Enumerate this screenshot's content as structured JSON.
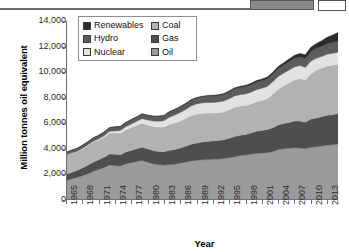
{
  "top_bar": {
    "present": true,
    "description": "cropped-ui-strip"
  },
  "chart_data": {
    "type": "area",
    "stacked": true,
    "title": "",
    "xlabel": "Year",
    "ylabel": "Million tonnes oil equivalent",
    "ylim": [
      0,
      14000
    ],
    "yticks": [
      "0",
      "2,000",
      "4,000",
      "6,000",
      "8,000",
      "10,000",
      "12,000",
      "14,000"
    ],
    "ytick_values": [
      0,
      2000,
      4000,
      6000,
      8000,
      10000,
      12000,
      14000
    ],
    "grid": false,
    "legend_position": "upper-left-inside",
    "xlim": [
      1965,
      2015
    ],
    "xtick_labels": [
      "1965",
      "1968",
      "1971",
      "1974",
      "1977",
      "1980",
      "1983",
      "1986",
      "1989",
      "1992",
      "1995",
      "1998",
      "2001",
      "2004",
      "2007",
      "2010",
      "2013"
    ],
    "xtick_values": [
      1965,
      1968,
      1971,
      1974,
      1977,
      1980,
      1983,
      1986,
      1989,
      1992,
      1995,
      1998,
      2001,
      2004,
      2007,
      2010,
      2013
    ],
    "x": [
      1965,
      1966,
      1967,
      1968,
      1969,
      1970,
      1971,
      1972,
      1973,
      1974,
      1975,
      1976,
      1977,
      1978,
      1979,
      1980,
      1981,
      1982,
      1983,
      1984,
      1985,
      1986,
      1987,
      1988,
      1989,
      1990,
      1991,
      1992,
      1993,
      1994,
      1995,
      1996,
      1997,
      1998,
      1999,
      2000,
      2001,
      2002,
      2003,
      2004,
      2005,
      2006,
      2007,
      2008,
      2009,
      2010,
      2011,
      2012,
      2013,
      2014,
      2015
    ],
    "series": [
      {
        "name": "Oil",
        "color": "#9b9b9b",
        "values": [
          1530,
          1650,
          1760,
          1900,
          2060,
          2250,
          2380,
          2530,
          2740,
          2700,
          2660,
          2830,
          2920,
          3010,
          3090,
          2960,
          2830,
          2760,
          2730,
          2780,
          2790,
          2900,
          2960,
          3060,
          3110,
          3150,
          3160,
          3200,
          3200,
          3250,
          3310,
          3390,
          3480,
          3520,
          3590,
          3650,
          3680,
          3700,
          3790,
          3950,
          4010,
          4050,
          4090,
          4070,
          4020,
          4130,
          4170,
          4230,
          4290,
          4330,
          4380
        ]
      },
      {
        "name": "Gas",
        "color": "#4e4e4e",
        "values": [
          480,
          510,
          550,
          600,
          650,
          710,
          760,
          810,
          860,
          880,
          880,
          930,
          960,
          1000,
          1040,
          1040,
          1040,
          1040,
          1040,
          1110,
          1150,
          1170,
          1240,
          1300,
          1350,
          1390,
          1420,
          1430,
          1450,
          1460,
          1510,
          1580,
          1590,
          1610,
          1660,
          1730,
          1760,
          1810,
          1860,
          1920,
          1980,
          2020,
          2080,
          2110,
          2060,
          2200,
          2250,
          2290,
          2330,
          2340,
          2390
        ]
      },
      {
        "name": "Coal",
        "color": "#b2b2b2",
        "values": [
          1480,
          1490,
          1460,
          1490,
          1540,
          1570,
          1560,
          1590,
          1640,
          1660,
          1690,
          1740,
          1790,
          1820,
          1880,
          1870,
          1880,
          1900,
          1940,
          2020,
          2080,
          2110,
          2170,
          2230,
          2260,
          2250,
          2220,
          2170,
          2170,
          2180,
          2230,
          2280,
          2290,
          2260,
          2250,
          2300,
          2340,
          2400,
          2630,
          2800,
          2940,
          3090,
          3230,
          3320,
          3310,
          3520,
          3720,
          3800,
          3860,
          3880,
          3840
        ]
      },
      {
        "name": "Nuclear",
        "color": "#e2e2e2",
        "values": [
          20,
          25,
          30,
          40,
          50,
          60,
          80,
          100,
          130,
          160,
          200,
          230,
          270,
          320,
          350,
          380,
          420,
          450,
          480,
          560,
          620,
          660,
          700,
          760,
          780,
          800,
          820,
          830,
          840,
          850,
          870,
          890,
          880,
          900,
          930,
          950,
          960,
          970,
          960,
          980,
          990,
          1000,
          1010,
          1010,
          970,
          1000,
          940,
          900,
          910,
          920,
          950
        ]
      },
      {
        "name": "Hydro",
        "color": "#5c5c5c",
        "values": [
          210,
          220,
          230,
          240,
          250,
          260,
          270,
          280,
          290,
          310,
          320,
          330,
          340,
          350,
          360,
          370,
          380,
          390,
          400,
          420,
          430,
          440,
          450,
          460,
          470,
          480,
          490,
          500,
          510,
          520,
          540,
          560,
          570,
          580,
          590,
          600,
          600,
          610,
          610,
          630,
          640,
          660,
          680,
          700,
          710,
          760,
          780,
          800,
          840,
          860,
          880
        ]
      },
      {
        "name": "Renewables",
        "color": "#2b2b2b",
        "values": [
          5,
          5,
          6,
          6,
          7,
          8,
          9,
          10,
          11,
          12,
          13,
          15,
          16,
          18,
          20,
          22,
          24,
          26,
          28,
          31,
          34,
          37,
          40,
          44,
          48,
          52,
          56,
          60,
          65,
          70,
          76,
          82,
          89,
          96,
          104,
          113,
          122,
          133,
          145,
          160,
          178,
          199,
          224,
          254,
          288,
          330,
          380,
          435,
          500,
          575,
          660
        ]
      }
    ]
  },
  "legend": {
    "items": [
      {
        "label": "Renewables",
        "color": "#2b2b2b"
      },
      {
        "label": "Coal",
        "color": "#b2b2b2"
      },
      {
        "label": "Hydro",
        "color": "#5c5c5c"
      },
      {
        "label": "Gas",
        "color": "#4e4e4e"
      },
      {
        "label": "Nuclear",
        "color": "#e2e2e2"
      },
      {
        "label": "Oil",
        "color": "#9b9b9b"
      }
    ]
  }
}
